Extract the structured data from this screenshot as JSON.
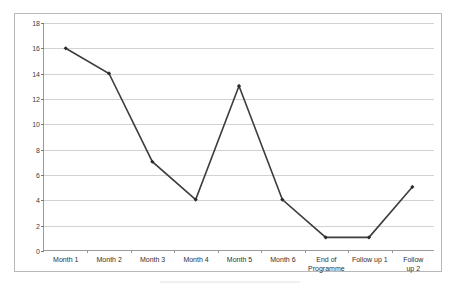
{
  "chart_data": {
    "type": "line",
    "title": "",
    "subtitle": "",
    "xlabel": "",
    "ylabel": "",
    "categories": [
      "Month 1",
      "Month 2",
      "Month 3",
      "Month 4",
      "Month 5",
      "Month 6",
      "End of\nProgramme",
      "Follow up 1",
      "Follow up 2"
    ],
    "values": [
      16,
      14,
      7,
      4,
      13,
      4,
      1,
      1,
      5
    ],
    "series": [
      {
        "name": "Series 1",
        "values": [
          16,
          14,
          7,
          4,
          13,
          4,
          1,
          1,
          5
        ]
      }
    ],
    "ylim": [
      0,
      18
    ],
    "ytick_labels": [
      "0",
      "2",
      "4",
      "6",
      "8",
      "10",
      "12",
      "14",
      "16",
      "18"
    ],
    "ytick_values": [
      0,
      2,
      4,
      6,
      8,
      10,
      12,
      14,
      16,
      18
    ],
    "grid": true,
    "grid_axis": "y",
    "legend": false,
    "legend_position": "none",
    "marker": "diamond",
    "line_color": "#3d3d3d",
    "marker_color": "#2b2b2b",
    "grid_color": "#d2d2d2",
    "axis_color": "#9a9a9a",
    "plot_background": "#ffffff",
    "annotations": []
  }
}
